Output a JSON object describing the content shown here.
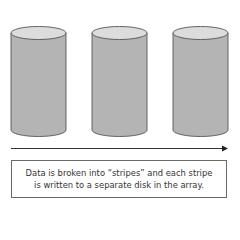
{
  "diagram": {
    "disks": [
      {
        "name": "disk-1"
      },
      {
        "name": "disk-2"
      },
      {
        "name": "disk-3"
      }
    ],
    "colors": {
      "disk_body": "#b4b4b4",
      "disk_top": "#dcdcdc",
      "outline": "#555555",
      "arrow": "#333333"
    },
    "caption": {
      "line1": "Data is broken into “stripes” and each stripe",
      "line2": "is written to a separate disk in the array."
    }
  }
}
